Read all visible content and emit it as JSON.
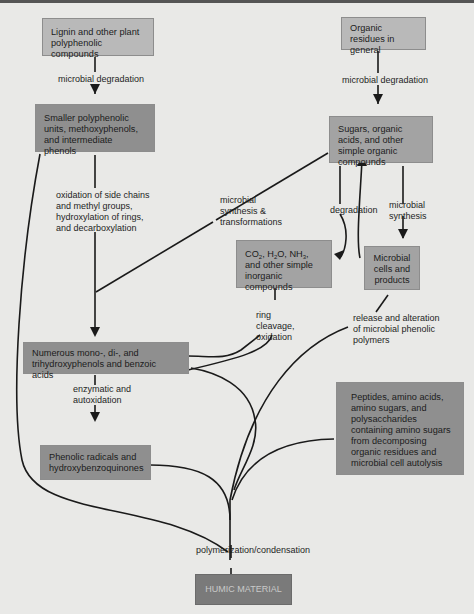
{
  "diagram": {
    "type": "flowchart",
    "boxes": {
      "lignin": "Lignin and other plant polyphenolic compounds",
      "organic_residues": "Organic residues in general",
      "smaller_polyphenolic": "Smaller polyphenolic units, methoxyphenols, and intermediate phenols",
      "sugars": "Sugars, organic acids, and other simple organic compounds",
      "inorganic": {
        "co2": "CO",
        "co2_sub": "2",
        "h2o_a": ", H",
        "h2o_sub": "2",
        "h2o_b": "O, NH",
        "nh_sub": "3",
        "rest": ", and other simple inorganic compounds"
      },
      "microbial_cells": "Microbial cells and products",
      "numerous_phenols": "Numerous mono-, di-, and trihydroxyphenols and benzoic acids",
      "phenolic_radicals": "Phenolic radicals and hydroxybenzoquinones",
      "peptides": "Peptides, amino acids, amino sugars, and polysaccharides containing amino sugars from decomposing organic residues and microbial cell autolysis",
      "humic": "HUMIC MATERIAL"
    },
    "labels": {
      "microbial_degradation_left": "microbial degradation",
      "microbial_degradation_right": "microbial degradation",
      "oxidation": "oxidation of side chains and methyl groups, hydroxylation of rings, and decarboxylation",
      "microbial_synthesis_transformations": "microbial synthesis & transformations",
      "degradation": "degradation",
      "microbial_synthesis": "microbial synthesis",
      "ring_cleavage": "ring cleavage, oxidation",
      "release_alteration": "release and alteration of microbial phenolic polymers",
      "enzymatic": "enzymatic and autoxidation",
      "polymerization": "polymerization/condensation"
    },
    "edges": [
      {
        "from": "lignin",
        "to": "smaller_polyphenolic",
        "label": "microbial degradation"
      },
      {
        "from": "organic_residues",
        "to": "sugars",
        "label": "microbial degradation"
      },
      {
        "from": "smaller_polyphenolic",
        "to": "numerous_phenols",
        "label": "oxidation of side chains and methyl groups, hydroxylation of rings, and decarboxylation"
      },
      {
        "from": "sugars",
        "to": "numerous_phenols",
        "label": "microbial synthesis & transformations"
      },
      {
        "from": "sugars",
        "to": "inorganic",
        "label": "degradation"
      },
      {
        "from": "microbial_cells",
        "to": "sugars",
        "label": ""
      },
      {
        "from": "sugars",
        "to": "microbial_cells",
        "label": "microbial synthesis"
      },
      {
        "from": "numerous_phenols",
        "to": "inorganic",
        "label": "ring cleavage, oxidation"
      },
      {
        "from": "microbial_cells",
        "to": "humic",
        "label": "release and alteration of microbial phenolic polymers"
      },
      {
        "from": "numerous_phenols",
        "to": "phenolic_radicals",
        "label": "enzymatic and autoxidation"
      },
      {
        "from": "smaller_polyphenolic",
        "to": "humic",
        "label": ""
      },
      {
        "from": "numerous_phenols",
        "to": "humic",
        "label": ""
      },
      {
        "from": "phenolic_radicals",
        "to": "humic",
        "label": ""
      },
      {
        "from": "peptides",
        "to": "humic",
        "label": "polymerization/condensation"
      }
    ]
  },
  "colors": {
    "background": "#e9e9e7",
    "box_light": "#b9b9b9",
    "box_mid": "#a3a3a3",
    "box_dark": "#8f8f8f",
    "humic_box": "#7a7a7a",
    "line": "#1a1a1a"
  }
}
